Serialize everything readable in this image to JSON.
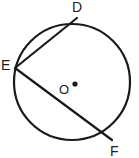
{
  "figure": {
    "kind": "circle-with-inscribed-angle",
    "background_color": "#ffffff",
    "stroke_color": "#1a1a1a",
    "label_color": "#1a1a1a",
    "circle": {
      "center_x": 72,
      "center_y": 82,
      "radius": 58,
      "stroke_width": 2.2
    },
    "center_point": {
      "label": "O",
      "marker_x": 75,
      "marker_y": 84,
      "marker_radius": 2.6
    },
    "points": [
      {
        "label": "D",
        "x": 77,
        "y": 18
      },
      {
        "label": "E",
        "x": 15,
        "y": 68
      },
      {
        "label": "F",
        "x": 112,
        "y": 140
      }
    ],
    "chords": [
      {
        "name": "chord-ED",
        "from": "E",
        "to": "D",
        "x1": 15,
        "y1": 68,
        "x2": 77,
        "y2": 18,
        "stroke_width": 2.2
      },
      {
        "name": "chord-EF",
        "from": "E",
        "to": "F",
        "x1": 15,
        "y1": 68,
        "x2": 112,
        "y2": 140,
        "stroke_width": 2.2
      }
    ]
  }
}
